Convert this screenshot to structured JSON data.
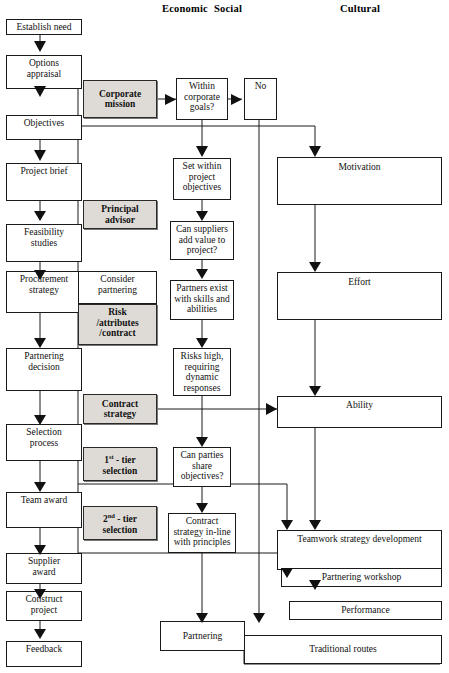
{
  "diagram": {
    "headers": [
      {
        "id": "economic",
        "label": "Economic"
      },
      {
        "id": "social",
        "label": "Social"
      },
      {
        "id": "cultural",
        "label": "Cultural"
      }
    ],
    "nodes": {
      "establish_need": "Establish need",
      "options_appraisal": "Options\nappraisal",
      "objectives": "Objectives",
      "project_brief": "Project brief",
      "feasibility_studies": "Feasibility\nstudies",
      "procurement_strategy": "Procurement\nstrategy",
      "partnering_decision": "Partnering\ndecision",
      "selection_process": "Selection\nprocess",
      "team_award": "Team award",
      "supplier_award": "Supplier\naward",
      "construct_project": "Construct\nproject",
      "feedback": "Feedback",
      "corporate_mission": "Corporate\nmission",
      "principal_advisor": "Principal\nadvisor",
      "consider_partnering": "Consider\npartnering",
      "risk_attributes_contract": "Risk\n/attributes\n/contract",
      "contract_strategy": "Contract\nstrategy",
      "first_tier_selection": "1st - tier\nselection",
      "second_tier_selection": "2nd - tier\nselection",
      "within_corporate_goals": "Within\ncorporate\ngoals?",
      "no": "No",
      "set_within_project_objectives": "Set within\nproject\nobjectives",
      "can_suppliers_add_value": "Can suppliers\nadd value to\nproject?",
      "partners_exist": "Partners exist\nwith skills and\nabilities",
      "risks_high": "Risks high,\nrequiring\ndynamic\nresponses",
      "can_parties_share_objectives": "Can parties\nshare\nobjectives?",
      "contract_strategy_in_line": "Contract\nstrategy in-line\nwith principles",
      "partnering": "Partnering",
      "motivation": "Motivation",
      "effort": "Effort",
      "ability": "Ability",
      "teamwork_strategy_development": "Teamwork strategy development",
      "partnering_workshop": "Partnering workshop",
      "performance": "Performance",
      "traditional_routes": "Traditional routes"
    },
    "colors": {
      "line": "#1a1a1a",
      "shaded_fill": "#dedbd6",
      "background": "#ffffff"
    }
  }
}
